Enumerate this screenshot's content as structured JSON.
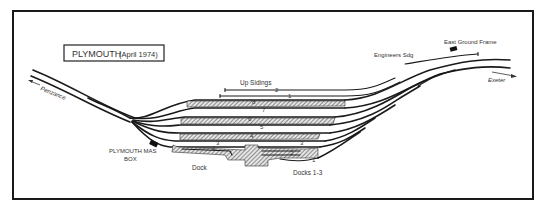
{
  "title": {
    "main": "PLYMOUTH",
    "subtitle": "(April 1974)"
  },
  "labels": {
    "up_sidings": "Up Sidings",
    "engineers_sdg": "Engineers Sdg",
    "east_ground_frame": "East Ground Frame",
    "exeter": "Exeter",
    "penzance": "Penzance",
    "signal_box_line1": "PLYMOUTH MAS",
    "signal_box_line2": "BOX",
    "dock": "Dock",
    "docks_1_3": "Docks 1-3"
  },
  "platform_numbers": {
    "p2": "2",
    "p1": "1",
    "p8": "8",
    "p7": "7",
    "p6": "6",
    "p5": "5",
    "p4": "4",
    "p3": "3",
    "d3": "3",
    "d2": "2",
    "d1": "1",
    "p4b": "4",
    "p3b": "3"
  },
  "colors": {
    "line": "#1a1a1a",
    "hatch": "#555555",
    "background": "#ffffff"
  }
}
